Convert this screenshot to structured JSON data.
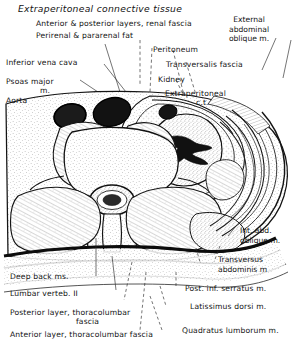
{
  "figure": {
    "title": "Extraperitoneal connective tissue",
    "type": "anatomical-cross-section",
    "region": "axial section through abdomen at level of second lumbar vertebra",
    "style": "line drawing / stipple engraving, black on white"
  },
  "labels": {
    "title": "Extraperitoneal connective tissue",
    "renal_fascia": "Anterior & posterior layers, renal fascia",
    "fat": "Perirenal & pararenal fat",
    "external_oblique_l1": "External",
    "external_oblique_l2": "abdominal",
    "external_oblique_l3": "oblique m.",
    "ivc": "Inferior vena cava",
    "psoas_l1": "Psoas major",
    "psoas_l2": "m.",
    "aorta": "Aorta",
    "peritoneum": "Peritoneum",
    "transversalis_fascia": "Transversalis fascia",
    "kidney": "Kidney",
    "extraperitoneal_l1": "Extraperitoneal",
    "extraperitoneal_l2": "c.t.",
    "internal_oblique_l1": "Int. abd.",
    "internal_oblique_l2": "oblique m.",
    "transversus_l1": "Transversus",
    "transversus_l2": "abdominis m",
    "serratus": "Post. inf. serratus m.",
    "latissimus": "Latissimus dorsi m.",
    "quadratus": "Quadratus lumborum m.",
    "deep_back": "Deep back ms.",
    "lumbar_vertebra": "Lumbar verteb. II",
    "posterior_layer_l1": "Posterior layer, thoracolumbar",
    "posterior_layer_l2": "fascia",
    "anterior_layer": "Anterior layer, thoracolumbar fascia"
  },
  "colors": {
    "ink": "#131313",
    "background": "#ffffff",
    "leader": "#2b2b2b",
    "stipple": "#6a6a6a"
  }
}
